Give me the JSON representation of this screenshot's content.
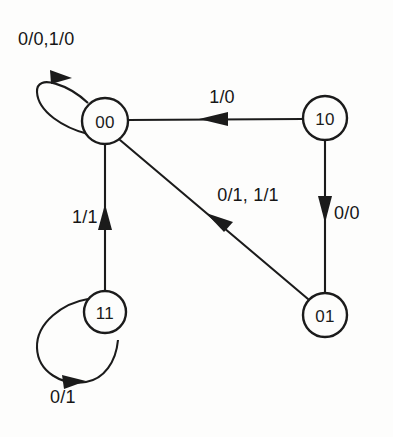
{
  "diagram": {
    "type": "state-transition-diagram",
    "background_color": "#fdfdfc",
    "line_color": "#1b1b1b",
    "states": [
      {
        "id": "s00",
        "label": "00",
        "cx": 105,
        "cy": 121,
        "r": 23
      },
      {
        "id": "s10",
        "label": "10",
        "cx": 325,
        "cy": 118,
        "r": 22
      },
      {
        "id": "s01",
        "label": "01",
        "cx": 325,
        "cy": 315,
        "r": 22
      },
      {
        "id": "s11",
        "label": "11",
        "cx": 105,
        "cy": 312,
        "r": 21
      }
    ],
    "transitions": [
      {
        "id": "t-00-self",
        "from": "00",
        "to": "00",
        "label": "0/0,1/0",
        "label_x": 18,
        "label_y": 40,
        "label_anchor": "start",
        "kind": "self-loop",
        "direction": "upper-left"
      },
      {
        "id": "t-10-00",
        "from": "10",
        "to": "00",
        "label": "1/0",
        "label_x": 222,
        "label_y": 98,
        "label_anchor": "middle",
        "kind": "straight",
        "direction": "right-to-left"
      },
      {
        "id": "t-10-01",
        "from": "10",
        "to": "01",
        "label": "0/0",
        "label_x": 334,
        "label_y": 214,
        "label_anchor": "start",
        "kind": "straight",
        "direction": "top-to-bottom"
      },
      {
        "id": "t-01-00",
        "from": "01",
        "to": "00",
        "label": "0/1, 1/1",
        "label_x": 248,
        "label_y": 196,
        "label_anchor": "middle",
        "kind": "straight",
        "direction": "diagonal-up-left"
      },
      {
        "id": "t-11-00",
        "from": "11",
        "to": "00",
        "label": "1/1",
        "label_x": 72,
        "label_y": 218,
        "label_anchor": "start",
        "kind": "straight",
        "direction": "bottom-to-top"
      },
      {
        "id": "t-11-self",
        "from": "11",
        "to": "11",
        "label": "0/1",
        "label_x": 50,
        "label_y": 398,
        "label_anchor": "start",
        "kind": "self-loop",
        "direction": "lower-left"
      }
    ]
  }
}
